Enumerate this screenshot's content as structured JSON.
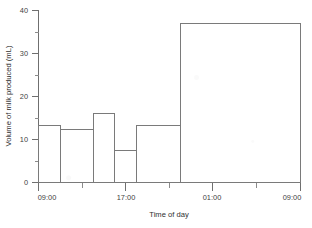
{
  "chart_data": {
    "type": "bar",
    "title": "",
    "subtitle": "",
    "xlabel": "Time of day",
    "ylabel": "Volume of milk produced (mL)",
    "xlim": [
      0,
      24
    ],
    "ylim": [
      0,
      40
    ],
    "grid": false,
    "legend": null,
    "x_unit": "hours after 09:00",
    "y_tick_labels": [
      "0",
      "10",
      "20",
      "30",
      "40"
    ],
    "y_tick_values": [
      0,
      10,
      20,
      30,
      40
    ],
    "y_minor_tick_values": [
      5,
      15,
      25,
      35
    ],
    "x_tick_labels": [
      "09:00",
      "17:00",
      "01:00",
      "09:00"
    ],
    "x_tick_values": [
      0,
      8,
      16,
      24
    ],
    "x_minor_tick_values": [
      4,
      12,
      20
    ],
    "categories": [
      "09:00-11:00",
      "11:00-14:00",
      "14:00-16:00",
      "16:00-18:00",
      "18:00-21:00",
      "21:00-09:00"
    ],
    "values": [
      13.3,
      12.4,
      16.0,
      7.5,
      13.3,
      37.0
    ],
    "bars": [
      {
        "label": "09:00-11:00",
        "start": 0,
        "end": 2,
        "value": 13.3
      },
      {
        "label": "11:00-14:00",
        "start": 2,
        "end": 5,
        "value": 12.4
      },
      {
        "label": "14:00-16:00",
        "start": 5,
        "end": 7,
        "value": 16.0
      },
      {
        "label": "16:00-18:00",
        "start": 7,
        "end": 9,
        "value": 7.5
      },
      {
        "label": "18:00-21:00",
        "start": 9,
        "end": 13,
        "value": 13.3
      },
      {
        "label": "21:00-09:00",
        "start": 13,
        "end": 24,
        "value": 37.0
      }
    ]
  },
  "colors": {
    "background": "#ffffff",
    "axis": "#6f6f6f",
    "bar_stroke": "#7a7a7a",
    "text": "#3f3f3f"
  }
}
